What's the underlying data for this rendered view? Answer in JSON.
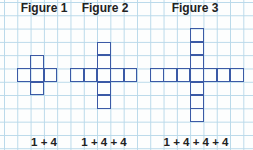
{
  "diagram": {
    "grid": {
      "pitch_px": 13.3,
      "line_color": "#b9d9ea",
      "origin": [
        4,
        2
      ]
    },
    "square_color": "#3b5aa6",
    "figures": [
      {
        "title": "Figure 1",
        "expression": "1 + 4",
        "arm_length": 1,
        "square_count": 5,
        "center_cell": [
          2,
          5
        ],
        "title_box": [
          14,
          60
        ],
        "expr_box": [
          14,
          60
        ]
      },
      {
        "title": "Figure 2",
        "expression": "1 + 4 + 4",
        "arm_length": 2,
        "square_count": 9,
        "center_cell": [
          7,
          5
        ],
        "title_box": [
          74,
          62
        ],
        "expr_box": [
          70,
          68
        ]
      },
      {
        "title": "Figure 3",
        "expression": "1 + 4 + 4 + 4",
        "arm_length": 3,
        "square_count": 13,
        "center_cell": [
          14,
          5
        ],
        "title_box": [
          160,
          70
        ],
        "expr_box": [
          150,
          92
        ]
      }
    ]
  }
}
